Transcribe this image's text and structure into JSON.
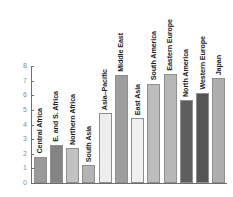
{
  "chart_data": {
    "type": "bar",
    "title": "",
    "subtitle": "",
    "xlabel": "",
    "ylabel": "",
    "ylim": [
      0,
      8
    ],
    "yticks": [
      0,
      1,
      2,
      3,
      4,
      5,
      6,
      7,
      8
    ],
    "ytick_labels": [
      "0",
      "1",
      "2",
      "3",
      "4",
      "5",
      "6",
      "7",
      "8"
    ],
    "grid": false,
    "legend": "none",
    "orientation": "vertical",
    "categories": [
      "Central Africa",
      "E. and S. Africa",
      "Northern Africa",
      "South Asia",
      "Asia–Pacific",
      "Middle East",
      "East Asia",
      "South America",
      "Eastern Europe",
      "North America",
      "Western Europe",
      "Japan"
    ],
    "values": [
      1.8,
      2.6,
      2.4,
      1.2,
      4.8,
      7.4,
      4.45,
      6.8,
      7.45,
      5.65,
      6.15,
      7.15
    ],
    "bar_colors": [
      "#9a9a9a",
      "#848484",
      "#c2c2c2",
      "#b4b4b4",
      "#ededed",
      "#9e9e9e",
      "#f0f0f0",
      "#bdbdbd",
      "#b7b7b7",
      "#5e5e5e",
      "#555555",
      "#adadad"
    ],
    "axis_color": "#6e6e6e",
    "tick_label_color": "#8a8a8a",
    "bar_label_color": "#1c1c1c",
    "background": "#ffffff"
  }
}
